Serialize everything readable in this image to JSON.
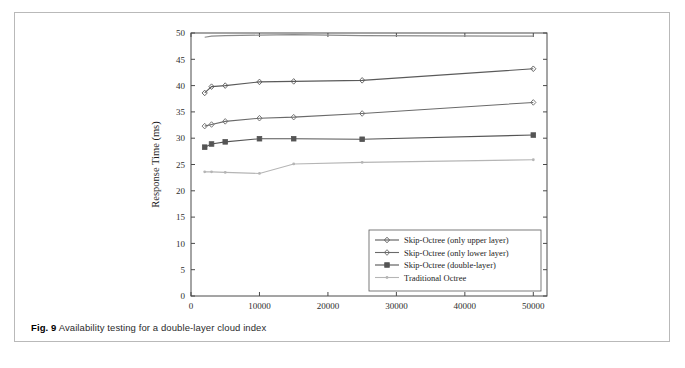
{
  "figure": {
    "caption_label": "Fig. 9",
    "caption_text": "Availability testing for a double-layer cloud index"
  },
  "chart_data": {
    "type": "line",
    "title": "",
    "xlabel": "Amount of data",
    "ylabel": "Response Time (ms)",
    "xlim": [
      0,
      52000
    ],
    "ylim": [
      0,
      50
    ],
    "xticks": [
      0,
      10000,
      20000,
      30000,
      40000,
      50000
    ],
    "xtick_labels": [
      "0",
      "10000",
      "20000",
      "30000",
      "40000",
      "50000"
    ],
    "yticks": [
      0,
      5,
      10,
      15,
      20,
      25,
      30,
      35,
      40,
      45,
      50
    ],
    "ytick_labels": [
      "0",
      "5",
      "10",
      "15",
      "20",
      "25",
      "30",
      "35",
      "40",
      "45",
      "50"
    ],
    "grid": false,
    "legend_position": "lower right",
    "x": [
      2000,
      3000,
      5000,
      10000,
      15000,
      25000,
      50000
    ],
    "series": [
      {
        "name": "Skip-Octree (only upper layer)",
        "color": "#5a5a5a",
        "marker": "diamond",
        "values": [
          38.6,
          39.8,
          40.0,
          40.7,
          40.8,
          41.0,
          43.2
        ]
      },
      {
        "name": "Skip-Octree (only lower layer)",
        "color": "#6a6a6a",
        "marker": "diamond",
        "values": [
          32.3,
          32.6,
          33.2,
          33.8,
          34.0,
          34.7,
          36.8
        ]
      },
      {
        "name": "Skip-Octree (double-layer)",
        "color": "#555555",
        "marker": "square",
        "values": [
          28.3,
          28.9,
          29.3,
          29.9,
          29.9,
          29.8,
          30.6
        ]
      },
      {
        "name": "Traditional Octree",
        "color": "#b5b5b5",
        "marker": "dot",
        "values": [
          23.6,
          23.6,
          23.5,
          23.3,
          25.1,
          25.4,
          25.9
        ]
      },
      {
        "name": "",
        "color": "#8a8a8a",
        "marker": "none",
        "values": [
          49.2,
          49.4,
          49.5,
          49.6,
          49.7,
          49.5,
          49.4
        ]
      }
    ]
  }
}
